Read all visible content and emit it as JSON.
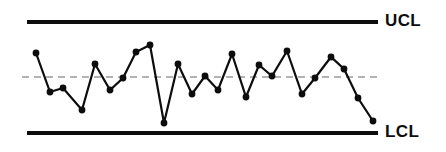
{
  "chart_data": {
    "type": "line",
    "title": "",
    "subtitle": "",
    "xlabel": "",
    "ylabel": "",
    "grid": false,
    "legend_position": "none",
    "annotations": [
      {
        "name": "ucl-label",
        "text": "UCL",
        "describes": "upper-control-limit"
      },
      {
        "name": "lcl-label",
        "text": "LCL",
        "describes": "lower-control-limit"
      }
    ],
    "reference_lines": [
      {
        "name": "upper-control-limit",
        "label": "UCL",
        "value": 22,
        "style": "solid",
        "color": "#0d0d0d",
        "width": 4.2
      },
      {
        "name": "center-line",
        "label": "",
        "value": 77,
        "style": "dashed",
        "color": "#9a9a9a",
        "width": 1.6
      },
      {
        "name": "lower-control-limit",
        "label": "LCL",
        "value": 133,
        "style": "solid",
        "color": "#0d0d0d",
        "width": 4.2
      }
    ],
    "axis_domain_x": [
      27,
      378
    ],
    "ylim": [
      133,
      22
    ],
    "series": [
      {
        "name": "process-measurements",
        "color": "#0d0d0d",
        "marker": "filled-circle",
        "marker_radius": 3.4,
        "x": [
          36,
          50,
          63,
          82,
          95,
          110,
          123,
          136,
          150,
          164,
          178,
          192,
          205,
          218,
          232,
          246,
          259,
          272,
          287,
          302,
          315,
          331,
          344,
          358,
          373
        ],
        "values": [
          53,
          92,
          88,
          110,
          64,
          90,
          78,
          52,
          45,
          123,
          64,
          94,
          76,
          90,
          54,
          97,
          65,
          76,
          51,
          94,
          78,
          57,
          69,
          98,
          121
        ]
      }
    ]
  },
  "labels": {
    "ucl": "UCL",
    "lcl": "LCL"
  }
}
